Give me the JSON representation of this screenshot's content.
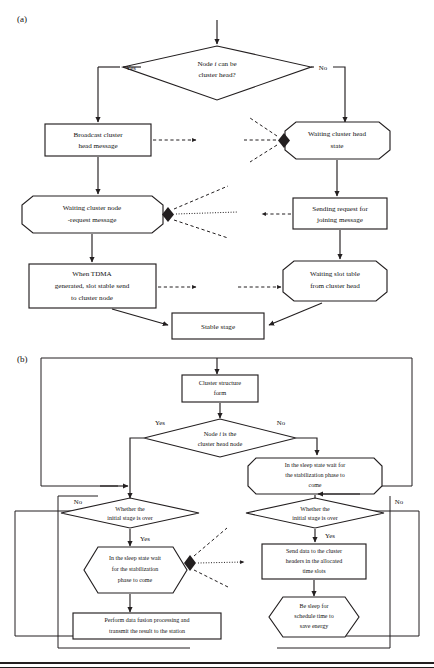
{
  "figure": {
    "panel_a": {
      "label": "(a)",
      "nodes": {
        "decision_head": {
          "line1": "Node ",
          "italic": "i",
          "line1b": " can be",
          "line2": "cluster head?"
        },
        "broadcast": {
          "line1": "Broadcast cluster",
          "line2": "head message"
        },
        "waiting_ch_state": {
          "line1": "Waiting cluster head",
          "line2": "state"
        },
        "waiting_node_req": {
          "line1": "Waiting cluster node",
          "line2": "-request message"
        },
        "sending_request": {
          "line1": "Sending request for",
          "line2": "joining message"
        },
        "tdma": {
          "line1": "When TDMA",
          "line2": "generated, slot stable send",
          "line3": "to cluster node"
        },
        "waiting_slot_table": {
          "line1": "Waiting slot table",
          "line2": "from cluster head"
        },
        "stable_stage": {
          "line1": "Stable stage"
        }
      },
      "edge_labels": {
        "yes": "Yes",
        "no": "No"
      }
    },
    "panel_b": {
      "label": "(b)",
      "nodes": {
        "cluster_form": {
          "line1": "Cluster structure",
          "line2": "form"
        },
        "decision_is_head": {
          "line1": "Node ",
          "italic": "i",
          "line1b": " is the",
          "line2": "cluster head node"
        },
        "sleep_wait_right": {
          "line1": "In the sleep state wait for",
          "line2": "the stabilization phase to",
          "line3": "come"
        },
        "whether_left": {
          "line1": "Whether the",
          "line2": "initial stage is over"
        },
        "whether_right": {
          "line1": "Whether the",
          "line2": "initial stage is over"
        },
        "sleep_wait_left": {
          "line1": "In the sleep state wait",
          "line2": "for the stabilization",
          "line3": "phase to come"
        },
        "send_data": {
          "line1": "Send data to the cluster",
          "line2": "headers in the allocated",
          "line3": "time slots"
        },
        "perform_fusion": {
          "line1": "Perform data fusion processing and",
          "line2": "transmit the result to the station"
        },
        "be_sleep": {
          "line1": "Be sleep for",
          "line2": "schedule time to",
          "line3": "save energy"
        }
      },
      "edge_labels": {
        "yes": "Yes",
        "no": "No"
      }
    }
  },
  "colors": {
    "ink": "#231f20",
    "paper": "#ffffff"
  }
}
